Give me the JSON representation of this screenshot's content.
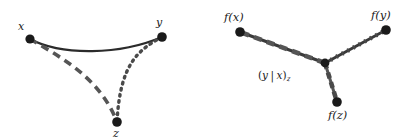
{
  "figure": {
    "canvas": {
      "width": 409,
      "height": 140,
      "background": "#ffffff"
    },
    "colors": {
      "node_fill": "#1a1a1a",
      "solid_edge": "#2b2b2b",
      "dashed_edge": "#555555",
      "dotted_edge": "#4a4a4a",
      "tripod_spine": "#3a3a3a",
      "label_text": "#1a1a1a"
    }
  },
  "left_panel": {
    "name": "geodesic-triangle",
    "nodes": [
      {
        "id": "x",
        "label": "x",
        "cx": 30,
        "cy": 39,
        "r": 4.6,
        "label_x": 18,
        "label_y": 21
      },
      {
        "id": "y",
        "label": "y",
        "cx": 162,
        "cy": 37,
        "r": 4.8,
        "label_x": 156,
        "label_y": 17
      },
      {
        "id": "z",
        "label": "z",
        "cx": 117,
        "cy": 122,
        "r": 4.8,
        "label_x": 113,
        "label_y": 128
      }
    ],
    "edges": [
      {
        "id": "edge-x-y",
        "style": "solid",
        "from": "x",
        "to": "y",
        "path": "M30,39 C62,56 120,55 162,37",
        "width": 2.3,
        "color": "#2b2b2b"
      },
      {
        "id": "edge-x-z",
        "style": "dashed",
        "from": "x",
        "to": "z",
        "path": "M30,39 C62,58 100,78 117,122",
        "width": 3.6,
        "color": "#555555",
        "dasharray": "8,5.5"
      },
      {
        "id": "edge-y-z",
        "style": "dotted",
        "from": "y",
        "to": "z",
        "path": "M162,37 C138,50 120,64 117,122",
        "width": 3.4,
        "color": "#4a4a4a",
        "dasharray": "1.6,4.6"
      }
    ]
  },
  "right_panel": {
    "name": "tripod",
    "nodes": [
      {
        "id": "fx",
        "label": "f(x)",
        "cx": 240,
        "cy": 32,
        "r": 4.8,
        "label_x": 224,
        "label_y": 12
      },
      {
        "id": "fy",
        "label": "f(y)",
        "cx": 386,
        "cy": 30,
        "r": 4.8,
        "label_x": 371,
        "label_y": 10
      },
      {
        "id": "fz",
        "label": "f(z)",
        "cx": 337,
        "cy": 102,
        "r": 4.8,
        "label_x": 328,
        "label_y": 110
      },
      {
        "id": "center",
        "label": "",
        "cx": 325,
        "cy": 63,
        "r": 4.4,
        "label_x": 0,
        "label_y": 0
      }
    ],
    "center_label": {
      "open_paren": "(",
      "var_y": "y",
      "mid_bar": "|",
      "var_x": "x",
      "close_paren": ")",
      "subscript": "z",
      "full_text": "(y | x)z",
      "x": 258,
      "y": 70
    },
    "edges": [
      {
        "id": "leg-center-fx",
        "style": "dashed-over-solid",
        "from": "center",
        "to": "fx",
        "path": "M325,63 L240,32",
        "spine_width": 3.0,
        "spine_color": "#3a3a3a",
        "overlay_width": 4.6,
        "overlay_color": "#555555",
        "dasharray": "8,5.5"
      },
      {
        "id": "leg-center-fy",
        "style": "dotted-over-solid",
        "from": "center",
        "to": "fy",
        "path": "M325,63 L386,30",
        "spine_width": 3.0,
        "spine_color": "#3a3a3a",
        "overlay_width": 4.4,
        "overlay_color": "#4a4a4a",
        "dasharray": "1.8,4.6"
      },
      {
        "id": "leg-center-fz",
        "style": "dashed-dotted",
        "from": "center",
        "to": "fz",
        "path": "M325,63 L337,102",
        "spine_width": 3.0,
        "spine_color": "#555555",
        "overlay_width": 4.6,
        "overlay_color": "#4a4a4a",
        "dasharray": "6,4"
      }
    ]
  }
}
